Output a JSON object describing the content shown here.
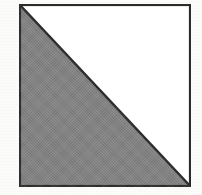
{
  "figure": {
    "kind": "geometry-diagram",
    "canvas": {
      "width": 202,
      "height": 195,
      "background_color": "#fcfcfb"
    },
    "square": {
      "name": "square-outline",
      "x": 19,
      "y": 4,
      "width": 172,
      "height": 183,
      "stroke_color": "#2b2b2b",
      "stroke_width": 2,
      "fill_color": "#ffffff"
    },
    "diagonal": {
      "name": "diagonal-line",
      "from": "top-left",
      "to": "bottom-right",
      "x1": 0,
      "y1": 0,
      "x2": 172,
      "y2": 183,
      "stroke_color": "#2b2b2b",
      "stroke_width": 2
    },
    "shaded_triangle": {
      "name": "lower-left-triangle",
      "vertices": "top-left, bottom-left, bottom-right",
      "points": "0,0 0,183 172,183",
      "fill_color": "#838383",
      "texture": "halftone-dither"
    },
    "unshaded_triangle": {
      "name": "upper-right-triangle",
      "vertices": "top-left, top-right, bottom-right",
      "points": "0,0 172,0 172,183",
      "fill_color": "#ffffff"
    },
    "caption": "Square divided by a diagonal; the lower-left half is shaded."
  }
}
